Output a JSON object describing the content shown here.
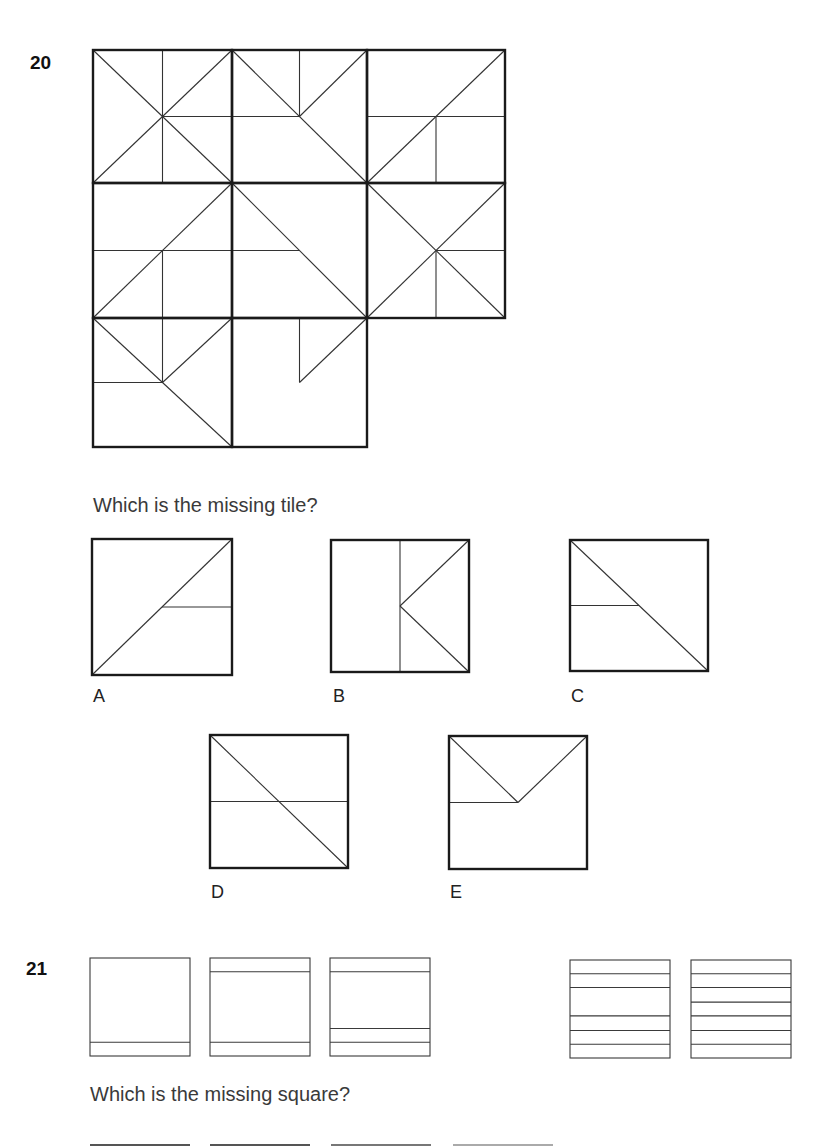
{
  "question20": {
    "number": "20",
    "prompt": "Which is the missing tile?",
    "grid": {
      "tiles": [
        {
          "row": 0,
          "col": 0,
          "lines": [
            [
              0,
              0,
              1,
              1
            ],
            [
              0,
              1,
              1,
              0
            ],
            [
              0.5,
              0,
              0.5,
              0.5
            ],
            [
              0.5,
              0.5,
              1,
              0.5
            ],
            [
              0.5,
              0.5,
              0.5,
              1
            ]
          ]
        },
        {
          "row": 0,
          "col": 1,
          "lines": [
            [
              0,
              0,
              1,
              1
            ],
            [
              1,
              0,
              0.5,
              0.5
            ],
            [
              0.5,
              0,
              0.5,
              0.5
            ],
            [
              0,
              0.5,
              0.5,
              0.5
            ]
          ]
        },
        {
          "row": 0,
          "col": 2,
          "lines": [
            [
              0,
              1,
              1,
              0
            ],
            [
              0,
              0.5,
              1,
              0.5
            ],
            [
              0.5,
              0.5,
              0.5,
              1
            ]
          ]
        },
        {
          "row": 1,
          "col": 0,
          "lines": [
            [
              0,
              1,
              1,
              0
            ],
            [
              0,
              0.5,
              1,
              0.5
            ],
            [
              0.5,
              0.5,
              0.5,
              1
            ]
          ]
        },
        {
          "row": 1,
          "col": 1,
          "lines": [
            [
              0,
              0,
              1,
              1
            ],
            [
              0,
              0.5,
              0.5,
              0.5
            ]
          ]
        },
        {
          "row": 1,
          "col": 2,
          "lines": [
            [
              0,
              0,
              1,
              1
            ],
            [
              0,
              1,
              1,
              0
            ],
            [
              0.5,
              0.5,
              1,
              0.5
            ],
            [
              0.5,
              0.5,
              0.5,
              1
            ]
          ]
        },
        {
          "row": 2,
          "col": 0,
          "lines": [
            [
              0,
              0,
              1,
              1
            ],
            [
              0.5,
              0.5,
              1,
              0
            ],
            [
              0.5,
              0,
              0.5,
              0.5
            ],
            [
              0,
              0.5,
              0.5,
              0.5
            ]
          ]
        },
        {
          "row": 2,
          "col": 1,
          "lines": [
            [
              0.5,
              0,
              0.5,
              0.5
            ],
            [
              0.5,
              0.5,
              1,
              0
            ]
          ]
        }
      ]
    },
    "options": [
      {
        "label": "A",
        "lines": [
          [
            0,
            1,
            1,
            0
          ],
          [
            0.5,
            0.5,
            1,
            0.5
          ]
        ]
      },
      {
        "label": "B",
        "lines": [
          [
            0.5,
            0,
            0.5,
            1
          ],
          [
            0.5,
            0.5,
            1,
            0
          ],
          [
            0.5,
            0.5,
            1,
            1
          ]
        ]
      },
      {
        "label": "C",
        "lines": [
          [
            0,
            0,
            1,
            1
          ],
          [
            0,
            0.5,
            0.5,
            0.5
          ]
        ]
      },
      {
        "label": "D",
        "lines": [
          [
            0,
            0,
            1,
            1
          ],
          [
            0,
            0.5,
            1,
            0.5
          ]
        ]
      },
      {
        "label": "E",
        "lines": [
          [
            0,
            0,
            0.5,
            0.5
          ],
          [
            0.5,
            0.5,
            1,
            0
          ],
          [
            0,
            0.5,
            0.5,
            0.5
          ]
        ]
      }
    ]
  },
  "question21": {
    "number": "21",
    "prompt": "Which is the missing square?",
    "squares": [
      {
        "lines_y": [
          0.86
        ]
      },
      {
        "lines_y": [
          0.14,
          0.86
        ]
      },
      {
        "lines_y": [
          0.14,
          0.72,
          0.86
        ]
      },
      {
        "missing": true
      },
      {
        "lines_y": [
          0.14,
          0.28,
          0.57,
          0.72,
          0.86
        ]
      },
      {
        "lines_y": [
          0.14,
          0.28,
          0.43,
          0.57,
          0.72,
          0.86
        ]
      }
    ]
  }
}
